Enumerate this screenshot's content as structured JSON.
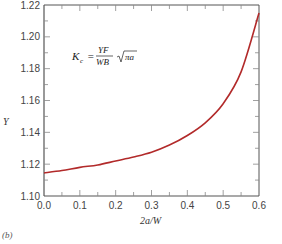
{
  "chart_data": {
    "type": "line",
    "title": "",
    "xlabel": "2a/W",
    "ylabel": "Y",
    "xlim": [
      0.0,
      0.6
    ],
    "ylim": [
      1.1,
      1.22
    ],
    "x_ticks": [
      "0.0",
      "0.1",
      "0.2",
      "0.3",
      "0.4",
      "0.5",
      "0.6"
    ],
    "y_ticks": [
      "1.10",
      "1.12",
      "1.14",
      "1.16",
      "1.18",
      "1.20",
      "1.22"
    ],
    "grid": false,
    "legend": null,
    "annotation": "K_c = (YF / WB) √(πa)",
    "series": [
      {
        "name": "Y",
        "color": "#b22a2a",
        "x": [
          0.0,
          0.05,
          0.1,
          0.15,
          0.2,
          0.25,
          0.3,
          0.35,
          0.4,
          0.45,
          0.5,
          0.55,
          0.6
        ],
        "y": [
          1.1145,
          1.116,
          1.118,
          1.1195,
          1.122,
          1.1245,
          1.1275,
          1.132,
          1.138,
          1.146,
          1.158,
          1.178,
          1.215
        ]
      }
    ]
  },
  "annotation": {
    "lhs": "K",
    "lhs_sub": "c",
    "equals": "=",
    "numerator": "YF",
    "denominator": "WB",
    "radicand": "πa"
  },
  "labels": {
    "ylabel": "Y",
    "xlabel": "2a/W",
    "panel": "(b)"
  }
}
